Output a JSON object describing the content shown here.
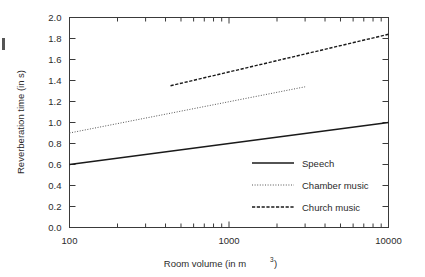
{
  "chart_data": {
    "type": "line",
    "title": "",
    "xlabel": "Room volume (in m³)",
    "xlabel_base": "Room volume (in m",
    "xlabel_sup": "3",
    "xlabel_tail": ")",
    "ylabel": "Reverberation time (in s)",
    "xscale": "log",
    "yscale": "linear",
    "xlim": [
      100,
      10000
    ],
    "ylim": [
      0.0,
      2.0
    ],
    "grid": false,
    "legend_position": "lower right inside plot",
    "xticks": [
      100,
      1000,
      10000
    ],
    "xtick_labels": [
      "100",
      "1000",
      "10000"
    ],
    "yticks": [
      0.0,
      0.2,
      0.4,
      0.6,
      0.8,
      1.0,
      1.2,
      1.4,
      1.6,
      1.8,
      2.0
    ],
    "ytick_labels": [
      "0.0",
      "0.2",
      "0.4",
      "0.6",
      "0.8",
      "1.0",
      "1.2",
      "1.4",
      "1.6",
      "1.8",
      "2.0"
    ],
    "series": [
      {
        "name": "Speech",
        "style": "solid",
        "color": "#1a1a1a",
        "width": 1.6,
        "x": [
          100,
          10000
        ],
        "y": [
          0.6,
          1.0
        ]
      },
      {
        "name": "Chamber music",
        "style": "dotted",
        "color": "#555555",
        "width": 1.0,
        "x": [
          100,
          3000
        ],
        "y": [
          0.9,
          1.34
        ]
      },
      {
        "name": "Church music",
        "style": "dashed",
        "color": "#1a1a1a",
        "width": 1.4,
        "x": [
          430,
          10000
        ],
        "y": [
          1.35,
          1.84
        ]
      }
    ]
  },
  "legend": {
    "items": [
      {
        "label": "Speech"
      },
      {
        "label": "Chamber music"
      },
      {
        "label": "Church music"
      }
    ]
  },
  "axes": {
    "y_title": "Reverberation time (in s)",
    "x_title_base": "Room volume (in m",
    "x_title_sup": "3",
    "x_title_tail": ")"
  }
}
